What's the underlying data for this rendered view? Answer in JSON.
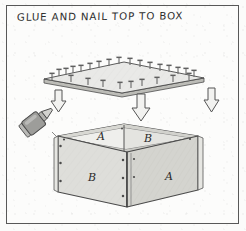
{
  "page": {
    "caption": "GLUE AND NAIL TOP TO BOX",
    "frame_color": "#585858",
    "paper_color": "#fcfcfb",
    "ink_color": "#3a3a3a"
  },
  "diagram": {
    "type": "exploded-assembly-illustration",
    "top_panel": {
      "name": "top-panel",
      "description": "flat rectangular board drawn in perspective, held above the box",
      "fill_color": "#e8e8e6",
      "edge_color": "#4a4a4a",
      "nail_count": 26,
      "nail_description": "T-shaped nails with flat heads protruding upward from the board",
      "nail_color": "#5a5a5a"
    },
    "arrows": [
      {
        "name": "arrow-left",
        "direction": "down",
        "label": ""
      },
      {
        "name": "arrow-center",
        "direction": "down",
        "label": ""
      },
      {
        "name": "arrow-right",
        "direction": "down",
        "label": ""
      }
    ],
    "glue_bottle": {
      "name": "glue-bottle",
      "description": "tilted glue bottle with conical nozzle aimed at the box corner",
      "body_color": "#9a9a98",
      "tip_color": "#c9c9c6",
      "angle_degrees": -38
    },
    "box": {
      "name": "open-box",
      "description": "open-topped box in three-quarter perspective view",
      "face_fill": "#dededa",
      "face_fill_dark": "#cfcfca",
      "interior_fill": "#ededea",
      "rim_fill": "#d6d6d1",
      "nail_head_color": "#4a4a4a",
      "panel_labels": [
        {
          "name": "label-inner-left",
          "text": "A",
          "location": "interior back-left wall"
        },
        {
          "name": "label-inner-right",
          "text": "B",
          "location": "interior back-right wall"
        },
        {
          "name": "label-outer-left",
          "text": "B",
          "location": "exterior front-left face"
        },
        {
          "name": "label-outer-right",
          "text": "A",
          "location": "exterior right face"
        }
      ]
    }
  }
}
